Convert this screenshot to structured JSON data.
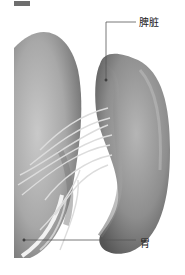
{
  "header": {
    "partial_text": "■ 内脏图"
  },
  "labels": {
    "spleen": "脾脏",
    "stomach": "胃"
  },
  "colors": {
    "organ_light": "#c8c8c8",
    "organ_mid": "#9a9a9a",
    "organ_dark": "#5e5e5e",
    "vessel": "#d9d9d9",
    "leader_line": "#555555"
  }
}
